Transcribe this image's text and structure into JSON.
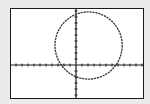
{
  "window": {
    "title": "Graph screen",
    "background_color": "#ebebeb",
    "screen_color": "#ffffff",
    "frame_color": "#1a1a1a",
    "curve_color": "#333333",
    "axis_color": "#1a1a1a"
  },
  "chart_data": {
    "type": "line",
    "title": "",
    "xlabel": "",
    "ylabel": "",
    "grid": false,
    "legend": null,
    "axes": {
      "x_tick_spacing": 1,
      "y_tick_spacing": 1,
      "xlim": [
        -11,
        11.3
      ],
      "ylim": [
        -5.7,
        9.5
      ],
      "origin_px": [
        76,
        65
      ],
      "px_per_unit": 6
    },
    "series": [
      {
        "name": "circle",
        "shape": "circle",
        "center": [
          2.1,
          3.25
        ],
        "radius": 5.6,
        "style": "dotted"
      }
    ],
    "x_intercepts_approx": [
      -2.4,
      6.6
    ],
    "y_intercepts_approx": [
      -1.0,
      7.5
    ]
  }
}
